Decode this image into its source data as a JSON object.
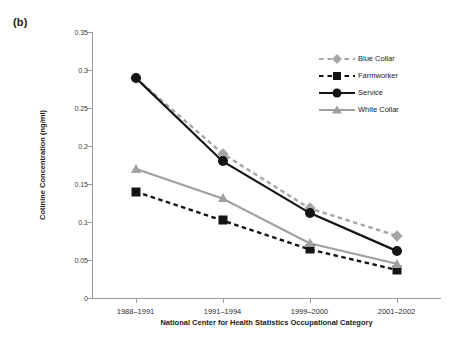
{
  "panel_label": "(b)",
  "chart_data": {
    "type": "line",
    "title": "",
    "subtitle": "",
    "xlabel": "National Center for Health Statistics Occupational Category",
    "ylabel": "Cotinine Concentration (ng/ml)",
    "categories": [
      "1988–1991",
      "1991–1994",
      "1999–2000",
      "2001–2002"
    ],
    "ylim": [
      0,
      0.35
    ],
    "yticks": [
      0,
      0.05,
      0.1,
      0.15,
      0.2,
      0.25,
      0.3,
      0.35
    ],
    "ytick_labels": [
      "0",
      "0.05",
      "0.1",
      "0.15",
      "0.2",
      "0.25",
      "0.3",
      "0.35"
    ],
    "grid": false,
    "legend_position": "top-right",
    "series": [
      {
        "name": "Blue Collar",
        "values": [
          0.29,
          0.19,
          0.118,
          0.082
        ],
        "color": "#a6a6a6",
        "line_style": "dashed",
        "marker": "diamond"
      },
      {
        "name": "Farmworker",
        "values": [
          0.14,
          0.102,
          0.064,
          0.037
        ],
        "color": "#141414",
        "line_style": "dashed",
        "marker": "square"
      },
      {
        "name": "Service",
        "values": [
          0.29,
          0.18,
          0.112,
          0.062
        ],
        "color": "#141414",
        "line_style": "solid",
        "marker": "circle"
      },
      {
        "name": "White Collar",
        "values": [
          0.17,
          0.131,
          0.072,
          0.045
        ],
        "color": "#a0a0a0",
        "line_style": "solid",
        "marker": "triangle"
      }
    ]
  },
  "legend": {
    "entries": [
      {
        "label": "Blue Collar"
      },
      {
        "label": "Farmworker"
      },
      {
        "label": "Service"
      },
      {
        "label": "White Collar"
      }
    ]
  }
}
